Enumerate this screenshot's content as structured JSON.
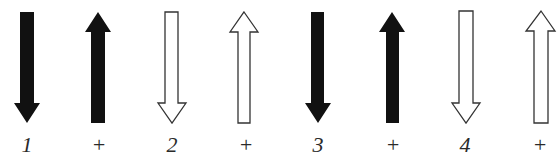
{
  "diagram": {
    "arrows": [
      {
        "direction": "down",
        "style": "filled",
        "label": "1",
        "cx": 27
      },
      {
        "direction": "up",
        "style": "filled",
        "label": "+",
        "cx": 98
      },
      {
        "direction": "down",
        "style": "outline",
        "label": "2",
        "cx": 172
      },
      {
        "direction": "up",
        "style": "outline",
        "label": "+",
        "cx": 244
      },
      {
        "direction": "down",
        "style": "filled",
        "label": "3",
        "cx": 318
      },
      {
        "direction": "up",
        "style": "filled",
        "label": "+",
        "cx": 392
      },
      {
        "direction": "down",
        "style": "outline",
        "label": "4",
        "cx": 466
      },
      {
        "direction": "up",
        "style": "outline",
        "label": "+",
        "cx": 541
      }
    ],
    "colors": {
      "fill": "#111111",
      "stroke": "#333333",
      "background": "#ffffff"
    }
  }
}
